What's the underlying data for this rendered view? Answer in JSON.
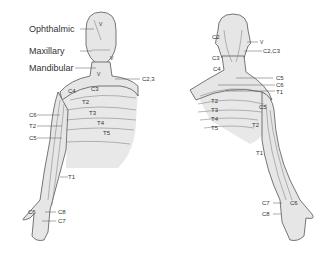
{
  "diagram": {
    "colors": {
      "skin": "#e6e6e6",
      "outline": "#555555",
      "boundary": "#888888",
      "label": "#333333",
      "background": "#ffffff"
    },
    "anterior": {
      "trigeminal_labels": [
        "Ophthalmic",
        "Maxillary",
        "Mandibular"
      ],
      "face_marks": [
        "V",
        "V",
        "V"
      ],
      "neck_label": "C2,3",
      "trunk_labels": [
        "C4",
        "C3",
        "T2",
        "T3",
        "T4",
        "T5"
      ],
      "arm_labels": [
        "C6",
        "T2",
        "C5",
        "T1"
      ],
      "hand_labels": [
        "C6",
        "C8",
        "C7"
      ]
    },
    "posterior": {
      "head_labels": [
        "C2",
        "C3",
        "C4"
      ],
      "side_labels": [
        "V",
        "C2,C3",
        "C5",
        "C6",
        "T1"
      ],
      "trunk_labels": [
        "T2",
        "T3",
        "T4",
        "T5"
      ],
      "arm_labels": [
        "C5",
        "T2",
        "T1"
      ],
      "hand_labels": [
        "C7",
        "C6",
        "C8"
      ]
    }
  }
}
